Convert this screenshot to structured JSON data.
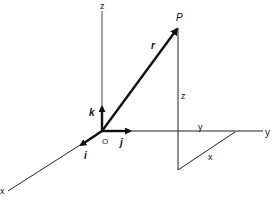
{
  "diagram": {
    "type": "3d-cartesian-position-vector",
    "colors": {
      "ink": "#111111",
      "background": "#ffffff"
    },
    "axes": {
      "z_label": "z",
      "y_label": "y",
      "x_label": "x"
    },
    "origin_label": "O",
    "unit_vectors": {
      "i": "i",
      "j": "j",
      "k": "k"
    },
    "point_label": "P",
    "position_vector_label": "r",
    "components": {
      "z_height_label": "z",
      "y_distance_label": "y",
      "x_distance_label": "x"
    }
  }
}
